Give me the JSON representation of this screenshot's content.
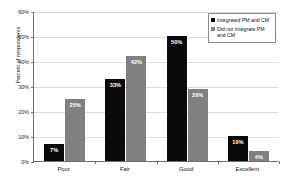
{
  "chart_data": {
    "type": "bar",
    "title": "",
    "xlabel": "",
    "ylabel": "Percent of respondents",
    "categories": [
      "Poor",
      "Fair",
      "Good",
      "Excellent"
    ],
    "series": [
      {
        "name": "Integrated PM and CM",
        "color": "#0a0a0a",
        "values": [
          7,
          33,
          50,
          10
        ],
        "labels": [
          "7%",
          "33%",
          "50%",
          "10%"
        ]
      },
      {
        "name": "Did not Integrate PM and CM",
        "color": "#808080",
        "values": [
          25,
          42,
          29,
          4
        ],
        "labels": [
          "25%",
          "42%",
          "29%",
          "4%"
        ]
      }
    ],
    "ylim": [
      0,
      60
    ],
    "ytick_values": [
      0,
      10,
      20,
      30,
      40,
      50,
      60
    ],
    "ytick_labels": [
      "0%",
      "10%",
      "20%",
      "30%",
      "40%",
      "50%",
      "60%"
    ],
    "grid": true,
    "legend_position": "top-right"
  },
  "legend": {
    "items": [
      {
        "label": "Integrated PM and CM",
        "swatch": "legend-swatch-black"
      },
      {
        "label": "Did not Integrate PM and CM",
        "swatch": "legend-swatch-gray"
      }
    ]
  },
  "colors": {
    "series_integrated": "#0a0a0a",
    "series_not_integrated": "#808080",
    "gridline": "#dcdcdc",
    "axis": "#6f6f6f",
    "background": "#ffffff",
    "bar_label_text": "#ffffff"
  }
}
